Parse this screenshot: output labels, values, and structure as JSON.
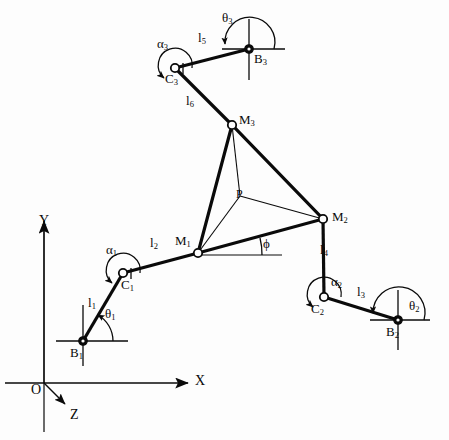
{
  "figure": {
    "background_color": "#fdfdfd",
    "stroke_color": "#0a0a0a",
    "width": 449,
    "height": 440
  },
  "axes": {
    "origin_label": "O",
    "x_label": "X",
    "y_label": "Y",
    "z_label": "Z"
  },
  "joints": [
    {
      "id": "B1",
      "label": "B",
      "sub": "1",
      "x": 83,
      "y": 341,
      "style": "grounded"
    },
    {
      "id": "B2",
      "label": "B",
      "sub": "2",
      "x": 398,
      "y": 320,
      "style": "grounded"
    },
    {
      "id": "B3",
      "label": "B",
      "sub": "3",
      "x": 249,
      "y": 49,
      "style": "grounded"
    },
    {
      "id": "C1",
      "label": "C",
      "sub": "1",
      "x": 123,
      "y": 273,
      "style": "open"
    },
    {
      "id": "C2",
      "label": "C",
      "sub": "2",
      "x": 324,
      "y": 297,
      "style": "open"
    },
    {
      "id": "C3",
      "label": "C",
      "sub": "3",
      "x": 175,
      "y": 68,
      "style": "open"
    },
    {
      "id": "M1",
      "label": "M",
      "sub": "1",
      "x": 198,
      "y": 253,
      "style": "open"
    },
    {
      "id": "M2",
      "label": "M",
      "sub": "2",
      "x": 323,
      "y": 219,
      "style": "open"
    },
    {
      "id": "M3",
      "label": "M",
      "sub": "3",
      "x": 232,
      "y": 125,
      "style": "open"
    },
    {
      "id": "P",
      "label": "P",
      "sub": "",
      "x": 240,
      "y": 196,
      "style": "none"
    }
  ],
  "links": [
    {
      "id": "l1",
      "label": "l",
      "sub": "1",
      "from": "B1",
      "to": "C1",
      "label_x": 94,
      "label_y": 303
    },
    {
      "id": "l2",
      "label": "l",
      "sub": "2",
      "from": "C1",
      "to": "M1",
      "label_x": 155,
      "label_y": 243
    },
    {
      "id": "l3",
      "label": "l",
      "sub": "3",
      "from": "B2",
      "to": "C2",
      "label_x": 361,
      "label_y": 292
    },
    {
      "id": "l4",
      "label": "l",
      "sub": "4",
      "from": "C2",
      "to": "M2",
      "label_x": 324,
      "label_y": 250
    },
    {
      "id": "l5",
      "label": "l",
      "sub": "5",
      "from": "B3",
      "to": "C3",
      "label_x": 202,
      "label_y": 38
    },
    {
      "id": "l6",
      "label": "l",
      "sub": "6",
      "from": "C3",
      "to": "M3",
      "label_x": 191,
      "label_y": 101
    }
  ],
  "platform": {
    "vertices": [
      "M1",
      "M2",
      "M3"
    ],
    "center": "P",
    "center_label": "P"
  },
  "angles": [
    {
      "id": "theta1",
      "glyph": "θ",
      "sub": "1",
      "at": "B1",
      "label_x": 109,
      "label_y": 315
    },
    {
      "id": "theta2",
      "glyph": "θ",
      "sub": "2",
      "at": "B2",
      "label_x": 413,
      "label_y": 307
    },
    {
      "id": "theta3",
      "glyph": "θ",
      "sub": "3",
      "at": "B3",
      "label_x": 227,
      "label_y": 19
    },
    {
      "id": "alpha1",
      "glyph": "α",
      "sub": "1",
      "at": "C1",
      "label_x": 111,
      "label_y": 250
    },
    {
      "id": "alpha2",
      "glyph": "α",
      "sub": "2",
      "at": "C2",
      "label_x": 335,
      "label_y": 282
    },
    {
      "id": "alpha3",
      "glyph": "α",
      "sub": "3",
      "at": "C3",
      "label_x": 161,
      "label_y": 44
    },
    {
      "id": "phi",
      "glyph": "ϕ",
      "sub": "",
      "at": "M1",
      "label_x": 266,
      "label_y": 244
    }
  ]
}
